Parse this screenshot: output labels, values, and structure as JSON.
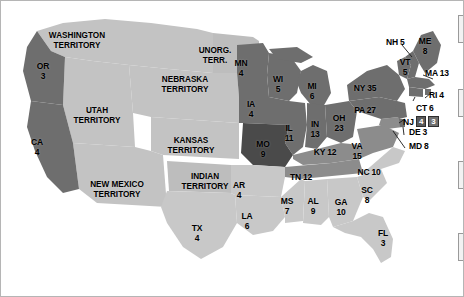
{
  "map": {
    "title": "United States Presidential Election Electoral Map, 1860",
    "background_color": "#ffffff",
    "border_color": "#b5b5b5",
    "shading": {
      "darkest": "#4a4a4a",
      "dark": "#6e6e6e",
      "medium": "#8c8c8c",
      "light": "#c8c8c8",
      "territory": "#c3c3c3",
      "border_line": "#ffffff"
    }
  },
  "states": [
    {
      "abbr": "OR",
      "votes": "3",
      "label": "OR\n3",
      "x": 42,
      "y": 66,
      "tier": "dark"
    },
    {
      "abbr": "CA",
      "votes": "4",
      "label": "CA\n4",
      "x": 36,
      "y": 142,
      "tier": "dark"
    },
    {
      "abbr": "MN",
      "votes": "4",
      "label": "MN\n4",
      "x": 240,
      "y": 63,
      "tier": "dark"
    },
    {
      "abbr": "WI",
      "votes": "5",
      "label": "WI\n5",
      "x": 277,
      "y": 79,
      "tier": "dark"
    },
    {
      "abbr": "IA",
      "votes": "4",
      "label": "IA\n4",
      "x": 250,
      "y": 104,
      "tier": "dark"
    },
    {
      "abbr": "MO",
      "votes": "9",
      "label": "MO\n9",
      "x": 262,
      "y": 144,
      "tier": "darkest"
    },
    {
      "abbr": "IL",
      "votes": "11",
      "label": "IL\n11",
      "x": 288,
      "y": 128,
      "tier": "dark"
    },
    {
      "abbr": "IN",
      "votes": "13",
      "label": "IN\n13",
      "x": 314,
      "y": 124,
      "tier": "dark"
    },
    {
      "abbr": "MI",
      "votes": "6",
      "label": "MI\n6",
      "x": 311,
      "y": 86,
      "tier": "dark"
    },
    {
      "abbr": "OH",
      "votes": "23",
      "label": "OH\n23",
      "x": 338,
      "y": 118,
      "tier": "dark"
    },
    {
      "abbr": "KY",
      "votes": "12",
      "label": "KY 12",
      "x": 324,
      "y": 152,
      "tier": "medium"
    },
    {
      "abbr": "TN",
      "votes": "12",
      "label": "TN 12",
      "x": 300,
      "y": 177,
      "tier": "medium"
    },
    {
      "abbr": "PA",
      "votes": "27",
      "label": "PA 27",
      "x": 364,
      "y": 110,
      "tier": "dark"
    },
    {
      "abbr": "NY",
      "votes": "35",
      "label": "NY 35",
      "x": 364,
      "y": 88,
      "tier": "dark"
    },
    {
      "abbr": "VA",
      "votes": "15",
      "label": "VA\n15",
      "x": 356,
      "y": 146,
      "tier": "medium"
    },
    {
      "abbr": "NC",
      "votes": "10",
      "label": "NC 10",
      "x": 368,
      "y": 172,
      "tier": "light"
    },
    {
      "abbr": "SC",
      "votes": "8",
      "label": "SC\n8",
      "x": 366,
      "y": 190,
      "tier": "light"
    },
    {
      "abbr": "GA",
      "votes": "10",
      "label": "GA\n10",
      "x": 340,
      "y": 202,
      "tier": "light"
    },
    {
      "abbr": "AL",
      "votes": "9",
      "label": "AL\n9",
      "x": 312,
      "y": 201,
      "tier": "light"
    },
    {
      "abbr": "MS",
      "votes": "7",
      "label": "MS\n7",
      "x": 286,
      "y": 201,
      "tier": "light"
    },
    {
      "abbr": "AR",
      "votes": "4",
      "label": "AR\n4",
      "x": 238,
      "y": 185,
      "tier": "light"
    },
    {
      "abbr": "LA",
      "votes": "6",
      "label": "LA\n6",
      "x": 246,
      "y": 216,
      "tier": "light"
    },
    {
      "abbr": "TX",
      "votes": "4",
      "label": "TX\n4",
      "x": 196,
      "y": 228,
      "tier": "light"
    },
    {
      "abbr": "FL",
      "votes": "3",
      "label": "FL\n3",
      "x": 382,
      "y": 233,
      "tier": "light"
    }
  ],
  "leader_states": [
    {
      "abbr": "NH",
      "votes": "5",
      "label": "NH 5",
      "x": 385,
      "y": 42,
      "align": "left"
    },
    {
      "abbr": "ME",
      "votes": "8",
      "label": "ME\n8",
      "x": 424,
      "y": 41,
      "align": "center"
    },
    {
      "abbr": "VT",
      "votes": "5",
      "label": "VT\n5",
      "x": 404,
      "y": 62,
      "align": "center"
    },
    {
      "abbr": "MA",
      "votes": "13",
      "label": "MA 13",
      "x": 424,
      "y": 73,
      "align": "left"
    },
    {
      "abbr": "RI",
      "votes": "4",
      "label": "RI 4",
      "x": 428,
      "y": 95,
      "align": "left"
    },
    {
      "abbr": "CT",
      "votes": "6",
      "label": "CT 6",
      "x": 415,
      "y": 108,
      "align": "left"
    },
    {
      "abbr": "DE",
      "votes": "3",
      "label": "DE 3",
      "x": 408,
      "y": 132,
      "align": "left"
    },
    {
      "abbr": "MD",
      "votes": "8",
      "label": "MD 8",
      "x": 408,
      "y": 146,
      "align": "left"
    }
  ],
  "split_state": {
    "abbr": "NJ",
    "label": "NJ",
    "x": 402,
    "y": 120,
    "chips": [
      "4",
      "3"
    ]
  },
  "territories": [
    {
      "name": "WASHINGTON\nTERRITORY",
      "x": 76,
      "y": 35
    },
    {
      "name": "NEBRASKA\nTERRITORY",
      "x": 184,
      "y": 79
    },
    {
      "name": "UNORG.\nTERR.",
      "x": 214,
      "y": 50
    },
    {
      "name": "UTAH\nTERRITORY",
      "x": 96,
      "y": 110
    },
    {
      "name": "KANSAS\nTERRITORY",
      "x": 190,
      "y": 140
    },
    {
      "name": "NEW MEXICO\nTERRITORY",
      "x": 116,
      "y": 184
    },
    {
      "name": "INDIAN\nTERRITORY",
      "x": 204,
      "y": 176
    }
  ]
}
